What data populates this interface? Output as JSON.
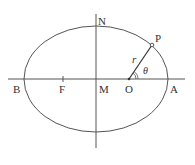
{
  "diagram": {
    "type": "ellipse-geometry",
    "labels": {
      "N": "N",
      "P": "P",
      "r": "r",
      "theta": "θ",
      "B": "B",
      "F": "F",
      "M": "M",
      "O": "O",
      "A": "A"
    },
    "caption": "",
    "colors": {
      "stroke": "#555555",
      "text": "#333333"
    }
  }
}
